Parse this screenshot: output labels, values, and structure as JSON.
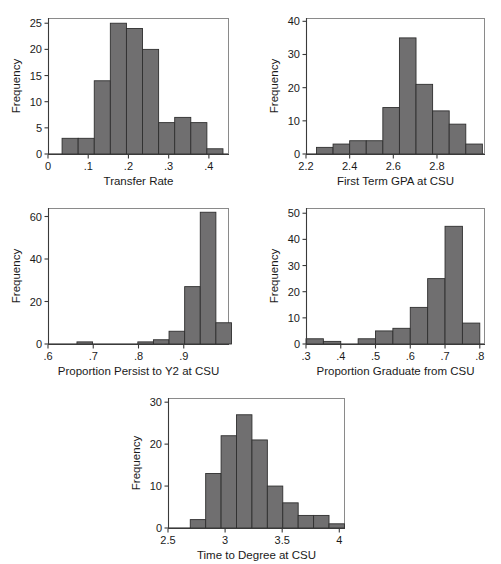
{
  "figure": {
    "background_color": "#ffffff",
    "bar_fill_color": "#706f70",
    "bar_stroke_color": "#2f2f2f",
    "axis_color": "#3a3a3a",
    "frame_color": "#8a8a8a",
    "panel_count": 5
  },
  "chart_data": [
    {
      "id": "transfer-rate",
      "type": "bar",
      "title": "",
      "xlabel": "Transfer Rate",
      "ylabel": "Frequency",
      "xlim": [
        0,
        0.45
      ],
      "ylim": [
        0,
        26
      ],
      "grid": false,
      "legend": "none",
      "xticks": [
        "0",
        ".1",
        ".2",
        ".3",
        ".4"
      ],
      "xtick_values": [
        0,
        0.1,
        0.2,
        0.3,
        0.4
      ],
      "yticks": [
        "0",
        "5",
        "10",
        "15",
        "20",
        "25"
      ],
      "ytick_values": [
        0,
        5,
        10,
        15,
        20,
        25
      ],
      "bin_width": 0.04,
      "bin_starts": [
        0.035,
        0.075,
        0.115,
        0.155,
        0.195,
        0.235,
        0.275,
        0.315,
        0.355,
        0.395
      ],
      "values": [
        3,
        3,
        14,
        25,
        24,
        20,
        6,
        7,
        6,
        1
      ]
    },
    {
      "id": "first-term-gpa",
      "type": "bar",
      "title": "",
      "xlabel": "First Term GPA at CSU",
      "ylabel": "Frequency",
      "xlim": [
        2.2,
        3.02
      ],
      "ylim": [
        0,
        41
      ],
      "grid": false,
      "legend": "none",
      "xticks": [
        "2.2",
        "2.4",
        "2.6",
        "2.8"
      ],
      "xtick_values": [
        2.2,
        2.4,
        2.6,
        2.8
      ],
      "yticks": [
        "0",
        "10",
        "20",
        "30",
        "40"
      ],
      "ytick_values": [
        0,
        10,
        20,
        30,
        40
      ],
      "bin_width": 0.076,
      "bin_starts": [
        2.248,
        2.324,
        2.4,
        2.476,
        2.552,
        2.628,
        2.704,
        2.78,
        2.856,
        2.932
      ],
      "values": [
        2,
        3,
        4,
        4,
        14,
        35,
        21,
        13,
        9,
        3
      ]
    },
    {
      "id": "proportion-persist",
      "type": "bar",
      "title": "",
      "xlabel": "Proportion Persist to Y2 at CSU",
      "ylabel": "Frequency",
      "xlim": [
        0.6,
        1.0
      ],
      "ylim": [
        0,
        64
      ],
      "grid": false,
      "legend": "none",
      "xticks": [
        ".6",
        ".7",
        ".8",
        ".9"
      ],
      "xtick_values": [
        0.6,
        0.7,
        0.8,
        0.9
      ],
      "yticks": [
        "0",
        "20",
        "40",
        "60"
      ],
      "ytick_values": [
        0,
        20,
        40,
        60
      ],
      "bin_width": 0.0345,
      "bin_starts": [
        0.664,
        0.7985,
        0.833,
        0.8675,
        0.902,
        0.9365
      ],
      "values": [
        1,
        1,
        2,
        6,
        27,
        62,
        10
      ],
      "bars": [
        {
          "start": 0.664,
          "width": 0.0345,
          "value": 1
        },
        {
          "start": 0.7985,
          "width": 0.0345,
          "value": 1
        },
        {
          "start": 0.833,
          "width": 0.0345,
          "value": 2
        },
        {
          "start": 0.8675,
          "width": 0.0345,
          "value": 6
        },
        {
          "start": 0.902,
          "width": 0.0345,
          "value": 27
        },
        {
          "start": 0.9365,
          "width": 0.0345,
          "value": 62
        },
        {
          "start": 0.971,
          "width": 0.0345,
          "value": 10
        }
      ]
    },
    {
      "id": "proportion-graduate",
      "type": "bar",
      "title": "",
      "xlabel": "Proportion Graduate from CSU",
      "ylabel": "Frequency",
      "xlim": [
        0.3,
        0.815
      ],
      "ylim": [
        0,
        52
      ],
      "grid": false,
      "legend": "none",
      "xticks": [
        ".3",
        ".4",
        ".5",
        ".6",
        ".7",
        ".8"
      ],
      "xtick_values": [
        0.3,
        0.4,
        0.5,
        0.6,
        0.7,
        0.8
      ],
      "yticks": [
        "0",
        "10",
        "20",
        "30",
        "40",
        "50"
      ],
      "ytick_values": [
        0,
        10,
        20,
        30,
        40,
        50
      ],
      "bin_width": 0.05,
      "bin_starts": [
        0.3,
        0.35,
        0.4,
        0.45,
        0.5,
        0.55,
        0.6,
        0.65,
        0.7,
        0.75
      ],
      "values": [
        2,
        1,
        0,
        2,
        5,
        6,
        14,
        25,
        45,
        8
      ]
    },
    {
      "id": "time-to-degree",
      "type": "bar",
      "title": "",
      "xlabel": "Time to Degree at CSU",
      "ylabel": "Frequency",
      "xlim": [
        2.5,
        4.05
      ],
      "ylim": [
        0,
        31
      ],
      "grid": false,
      "legend": "none",
      "xticks": [
        "2.5",
        "3",
        "3.5",
        "4"
      ],
      "xtick_values": [
        2.5,
        3,
        3.5,
        4
      ],
      "yticks": [
        "0",
        "10",
        "20",
        "30"
      ],
      "ytick_values": [
        0,
        10,
        20,
        30
      ],
      "bin_width": 0.135,
      "bin_starts": [
        2.695,
        2.83,
        2.965,
        3.1,
        3.235,
        3.37,
        3.505,
        3.64,
        3.775,
        3.91
      ],
      "values": [
        2,
        13,
        22,
        27,
        21,
        10,
        6,
        3,
        3,
        1
      ]
    }
  ]
}
